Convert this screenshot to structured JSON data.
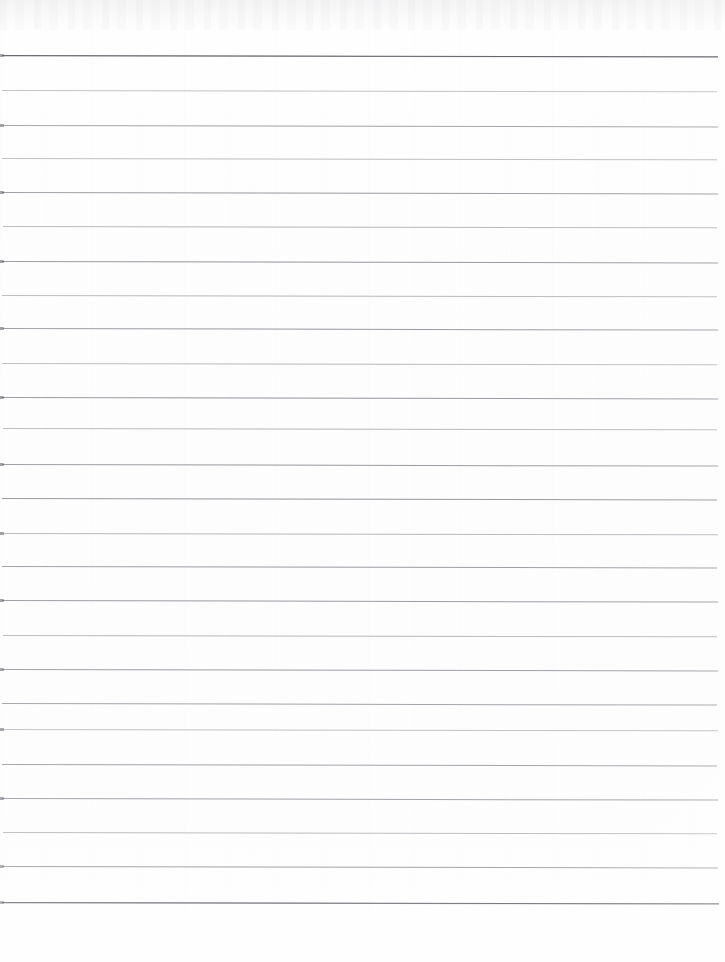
{
  "document": {
    "kind": "scanned-page",
    "description": "Blank ruled notebook paper, scanned",
    "content_text": "",
    "page_width": 725,
    "page_height": 962,
    "background_color": "#fdfdfd",
    "has_text": false,
    "has_margin_rule": false,
    "has_punch_holes": false,
    "has_header": false,
    "has_footer": false
  },
  "ruling": {
    "line_count": 25,
    "spacing_px": 35.3,
    "first_line_y": 55,
    "last_line_y": 902,
    "left_x": 2,
    "right_x": 718,
    "line_color": "#92929a",
    "emphasis_color": "#4a4a52",
    "line_thickness_px": 1,
    "skew_deg": 0.12,
    "lines": [
      {
        "y": 55,
        "x1": 2,
        "x2": 718,
        "weight": "strong",
        "opacity": 1.0,
        "skew": 0.1,
        "notch": true
      },
      {
        "y": 90,
        "x1": 2,
        "x2": 717,
        "weight": "light",
        "opacity": 0.62,
        "skew": 0.1,
        "notch": false
      },
      {
        "y": 125,
        "x1": 3,
        "x2": 718,
        "weight": "medium",
        "opacity": 0.8,
        "skew": 0.12,
        "notch": true
      },
      {
        "y": 158,
        "x1": 2,
        "x2": 717,
        "weight": "light",
        "opacity": 0.66,
        "skew": 0.1,
        "notch": false
      },
      {
        "y": 192,
        "x1": 2,
        "x2": 718,
        "weight": "medium",
        "opacity": 0.84,
        "skew": 0.12,
        "notch": true
      },
      {
        "y": 226,
        "x1": 3,
        "x2": 717,
        "weight": "light",
        "opacity": 0.7,
        "skew": 0.11,
        "notch": false
      },
      {
        "y": 261,
        "x1": 2,
        "x2": 718,
        "weight": "medium",
        "opacity": 0.86,
        "skew": 0.12,
        "notch": true
      },
      {
        "y": 295,
        "x1": 2,
        "x2": 717,
        "weight": "light",
        "opacity": 0.68,
        "skew": 0.1,
        "notch": false
      },
      {
        "y": 328,
        "x1": 3,
        "x2": 718,
        "weight": "medium",
        "opacity": 0.82,
        "skew": 0.13,
        "notch": true
      },
      {
        "y": 363,
        "x1": 2,
        "x2": 717,
        "weight": "light",
        "opacity": 0.64,
        "skew": 0.11,
        "notch": false
      },
      {
        "y": 397,
        "x1": 2,
        "x2": 718,
        "weight": "medium",
        "opacity": 0.85,
        "skew": 0.12,
        "notch": true
      },
      {
        "y": 428,
        "x1": 3,
        "x2": 717,
        "weight": "light",
        "opacity": 0.67,
        "skew": 0.1,
        "notch": false
      },
      {
        "y": 464,
        "x1": 2,
        "x2": 718,
        "weight": "medium",
        "opacity": 0.83,
        "skew": 0.13,
        "notch": true
      },
      {
        "y": 498,
        "x1": 2,
        "x2": 717,
        "weight": "medium",
        "opacity": 0.88,
        "skew": 0.12,
        "notch": false
      },
      {
        "y": 533,
        "x1": 3,
        "x2": 718,
        "weight": "light",
        "opacity": 0.7,
        "skew": 0.11,
        "notch": true
      },
      {
        "y": 566,
        "x1": 2,
        "x2": 717,
        "weight": "medium",
        "opacity": 0.84,
        "skew": 0.12,
        "notch": false
      },
      {
        "y": 600,
        "x1": 2,
        "x2": 718,
        "weight": "medium",
        "opacity": 0.86,
        "skew": 0.13,
        "notch": true
      },
      {
        "y": 635,
        "x1": 3,
        "x2": 717,
        "weight": "light",
        "opacity": 0.72,
        "skew": 0.11,
        "notch": false
      },
      {
        "y": 669,
        "x1": 2,
        "x2": 718,
        "weight": "medium",
        "opacity": 0.87,
        "skew": 0.12,
        "notch": true
      },
      {
        "y": 703,
        "x1": 2,
        "x2": 717,
        "weight": "medium",
        "opacity": 0.83,
        "skew": 0.13,
        "notch": false
      },
      {
        "y": 729,
        "x1": 3,
        "x2": 718,
        "weight": "light",
        "opacity": 0.66,
        "skew": 0.11,
        "notch": true
      },
      {
        "y": 764,
        "x1": 2,
        "x2": 717,
        "weight": "medium",
        "opacity": 0.85,
        "skew": 0.12,
        "notch": false
      },
      {
        "y": 798,
        "x1": 2,
        "x2": 718,
        "weight": "medium",
        "opacity": 0.88,
        "skew": 0.13,
        "notch": true
      },
      {
        "y": 832,
        "x1": 3,
        "x2": 717,
        "weight": "light",
        "opacity": 0.74,
        "skew": 0.11,
        "notch": false
      },
      {
        "y": 866,
        "x1": 2,
        "x2": 718,
        "weight": "medium",
        "opacity": 0.9,
        "skew": 0.12,
        "notch": true
      },
      {
        "y": 902,
        "x1": 2,
        "x2": 719,
        "weight": "strong",
        "opacity": 1.0,
        "skew": 0.1,
        "notch": true
      }
    ]
  }
}
